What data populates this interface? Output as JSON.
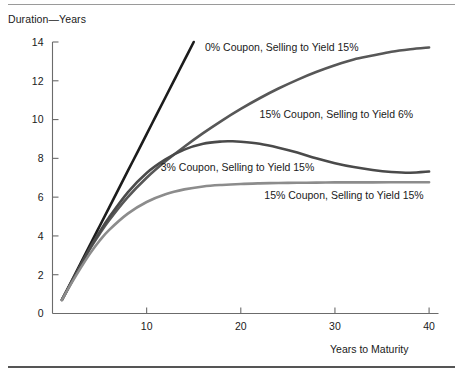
{
  "figure": {
    "y_axis_title": "Duration—Years",
    "x_axis_title": "Years to Maturity"
  },
  "chart_data": {
    "type": "line",
    "title": "",
    "subtitle": "",
    "xlabel": "Years to Maturity",
    "ylabel": "Duration—Years",
    "xlim": [
      0,
      41
    ],
    "ylim": [
      0,
      14
    ],
    "xticks": [
      10,
      20,
      30,
      40
    ],
    "yticks": [
      0,
      2,
      4,
      6,
      8,
      10,
      12,
      14
    ],
    "xtick_labels": [
      "10",
      "20",
      "30",
      "40"
    ],
    "ytick_labels": [
      "0",
      "2",
      "4",
      "6",
      "8",
      "10",
      "12",
      "14"
    ],
    "grid": false,
    "legend_position": "inline-annotations",
    "series": [
      {
        "name": "0% Coupon, Selling to Yield 15%",
        "color": "#1c1c1c",
        "width": 2.6,
        "label_x": 16.2,
        "label_y": 13.75,
        "x": [
          1,
          2,
          3,
          4,
          5,
          6,
          7,
          8,
          9,
          10,
          11,
          12,
          13,
          14,
          15
        ],
        "y": [
          0.7,
          1.65,
          2.6,
          3.55,
          4.5,
          5.45,
          6.4,
          7.35,
          8.3,
          9.25,
          10.2,
          11.15,
          12.1,
          13.05,
          14.0
        ]
      },
      {
        "name": "15% Coupon, Selling to Yield 6%",
        "color": "#575757",
        "width": 2.6,
        "label_x": 22.0,
        "label_y": 10.3,
        "x": [
          1,
          2,
          3,
          4,
          5,
          6,
          8,
          10,
          12,
          14,
          16,
          18,
          20,
          22,
          24,
          26,
          28,
          30,
          32,
          34,
          36,
          38,
          40
        ],
        "y": [
          0.7,
          1.6,
          2.5,
          3.35,
          4.1,
          4.8,
          6.0,
          7.0,
          7.85,
          8.6,
          9.3,
          9.95,
          10.55,
          11.1,
          11.6,
          12.05,
          12.45,
          12.8,
          13.1,
          13.3,
          13.5,
          13.63,
          13.72
        ]
      },
      {
        "name": "3% Coupon, Selling to Yield 15%",
        "color": "#4a4a4a",
        "width": 2.6,
        "label_x": 11.5,
        "label_y": 7.55,
        "x": [
          1,
          2,
          3,
          4,
          5,
          6,
          8,
          10,
          12,
          14,
          16,
          18,
          19,
          20,
          22,
          24,
          26,
          28,
          30,
          32,
          34,
          36,
          38,
          40
        ],
        "y": [
          0.7,
          1.6,
          2.5,
          3.4,
          4.2,
          4.95,
          6.25,
          7.25,
          7.95,
          8.45,
          8.75,
          8.87,
          8.88,
          8.86,
          8.75,
          8.55,
          8.3,
          8.0,
          7.75,
          7.55,
          7.4,
          7.3,
          7.26,
          7.32
        ]
      },
      {
        "name": "15% Coupon, Selling to Yield 15%",
        "color": "#8c8c8c",
        "width": 2.6,
        "label_x": 22.5,
        "label_y": 6.1,
        "x": [
          1,
          2,
          3,
          4,
          5,
          6,
          8,
          10,
          12,
          14,
          16,
          18,
          20,
          22,
          24,
          26,
          28,
          30,
          32,
          34,
          36,
          38,
          40
        ],
        "y": [
          0.7,
          1.55,
          2.35,
          3.1,
          3.75,
          4.3,
          5.15,
          5.75,
          6.15,
          6.4,
          6.55,
          6.63,
          6.68,
          6.71,
          6.73,
          6.74,
          6.75,
          6.76,
          6.76,
          6.76,
          6.77,
          6.77,
          6.77
        ]
      }
    ]
  }
}
